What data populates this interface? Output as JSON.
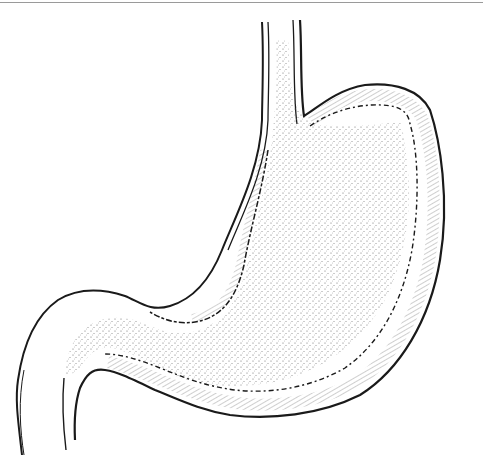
{
  "figure": {
    "style": "stippled line drawing",
    "colors": {
      "background": "#ffffff",
      "ink": "#1a1a1a",
      "stipple": "#555555",
      "border": "#9a9a9a"
    }
  }
}
